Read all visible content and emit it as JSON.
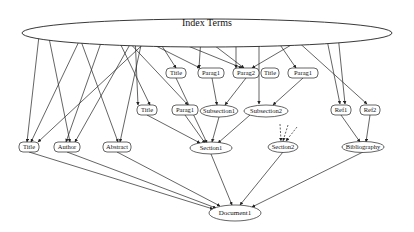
{
  "diagram": {
    "title_node": {
      "id": "index",
      "label": "Index Terms"
    },
    "nodes": [
      {
        "id": "it",
        "label": "Index Terms",
        "shape": "ellipse",
        "x": 207,
        "y": 33,
        "rx": 185,
        "ry": 14,
        "fs": 10
      },
      {
        "id": "t1",
        "label": "Title",
        "shape": "rounded",
        "x": 176,
        "y": 73,
        "w": 20,
        "fs": 6.5
      },
      {
        "id": "p1",
        "label": "Parag1",
        "shape": "rounded",
        "x": 211,
        "y": 73,
        "w": 26,
        "fs": 6.5
      },
      {
        "id": "p2",
        "label": "Parag2",
        "shape": "rounded",
        "x": 246,
        "y": 73,
        "w": 26,
        "fs": 6.5
      },
      {
        "id": "t2",
        "label": "Title",
        "shape": "rounded",
        "x": 270,
        "y": 73,
        "w": 18,
        "fs": 6.5
      },
      {
        "id": "p3",
        "label": "Parag1",
        "shape": "rounded",
        "x": 303,
        "y": 73,
        "w": 30,
        "fs": 6.5
      },
      {
        "id": "t3",
        "label": "Title",
        "shape": "rounded",
        "x": 147,
        "y": 110,
        "w": 20,
        "fs": 6.5
      },
      {
        "id": "p4",
        "label": "Parag1",
        "shape": "rounded",
        "x": 185,
        "y": 110,
        "w": 26,
        "fs": 6.5
      },
      {
        "id": "s1",
        "label": "Subsection1",
        "shape": "ellipse",
        "x": 219,
        "y": 111,
        "rx": 19,
        "ry": 6,
        "fs": 6.5
      },
      {
        "id": "s2",
        "label": "Subsection2",
        "shape": "ellipse",
        "x": 266,
        "y": 111,
        "rx": 22,
        "ry": 6,
        "fs": 6.5
      },
      {
        "id": "r1",
        "label": "Ref1",
        "shape": "rounded",
        "x": 341,
        "y": 110,
        "w": 20,
        "fs": 6.5
      },
      {
        "id": "r2",
        "label": "Ref2",
        "shape": "rounded",
        "x": 370,
        "y": 110,
        "w": 20,
        "fs": 6.5
      },
      {
        "id": "ta",
        "label": "Title",
        "shape": "rounded",
        "x": 29,
        "y": 147,
        "w": 20,
        "fs": 6.5
      },
      {
        "id": "au",
        "label": "Author",
        "shape": "rounded",
        "x": 67,
        "y": 147,
        "w": 26,
        "fs": 6.5
      },
      {
        "id": "ab",
        "label": "Abstract",
        "shape": "rounded",
        "x": 117,
        "y": 147,
        "w": 28,
        "fs": 6.5
      },
      {
        "id": "se1",
        "label": "Section1",
        "shape": "ellipse",
        "x": 211,
        "y": 148,
        "rx": 21,
        "ry": 6,
        "fs": 6.5
      },
      {
        "id": "se2",
        "label": "Section2",
        "shape": "ellipse",
        "x": 283,
        "y": 147,
        "rx": 15,
        "ry": 5.5,
        "fs": 6.5
      },
      {
        "id": "bib",
        "label": "Bibliography",
        "shape": "ellipse",
        "x": 363,
        "y": 147,
        "rx": 21,
        "ry": 5.5,
        "fs": 6.5
      },
      {
        "id": "doc",
        "label": "Document1",
        "shape": "ellipse",
        "x": 235,
        "y": 213,
        "rx": 26,
        "ry": 8,
        "fs": 7
      }
    ],
    "edges": [
      {
        "from": [
          40,
          27
        ],
        "to": [
          27,
          142
        ]
      },
      {
        "from": [
          47,
          28
        ],
        "to": [
          70,
          142
        ]
      },
      {
        "from": [
          83,
          33
        ],
        "to": [
          31,
          142
        ]
      },
      {
        "from": [
          78,
          33
        ],
        "to": [
          118,
          142
        ]
      },
      {
        "from": [
          103,
          37
        ],
        "to": [
          66,
          142
        ]
      },
      {
        "from": [
          117,
          37
        ],
        "to": [
          150,
          105
        ]
      },
      {
        "from": [
          152,
          36
        ],
        "to": [
          38,
          142
        ]
      },
      {
        "from": [
          125,
          38
        ],
        "to": [
          188,
          105
        ]
      },
      {
        "from": [
          137,
          32
        ],
        "to": [
          75,
          142
        ]
      },
      {
        "from": [
          135,
          35
        ],
        "to": [
          138,
          105
        ]
      },
      {
        "from": [
          143,
          36
        ],
        "to": [
          120,
          142
        ]
      },
      {
        "from": [
          155,
          35
        ],
        "to": [
          176,
          68
        ]
      },
      {
        "from": [
          161,
          35
        ],
        "to": [
          242,
          68
        ]
      },
      {
        "from": [
          134,
          35
        ],
        "to": [
          200,
          68
        ]
      },
      {
        "from": [
          201,
          37
        ],
        "to": [
          199,
          68
        ]
      },
      {
        "from": [
          202,
          36
        ],
        "to": [
          244,
          68
        ]
      },
      {
        "from": [
          236,
          38
        ],
        "to": [
          236,
          68
        ]
      },
      {
        "from": [
          259,
          37
        ],
        "to": [
          259,
          104
        ]
      },
      {
        "from": [
          274,
          36
        ],
        "to": [
          296,
          68
        ]
      },
      {
        "from": [
          315,
          31
        ],
        "to": [
          252,
          68
        ]
      },
      {
        "from": [
          285,
          30
        ],
        "to": [
          367,
          104
        ]
      },
      {
        "from": [
          326,
          35
        ],
        "to": [
          340,
          104
        ]
      },
      {
        "from": [
          338,
          35
        ],
        "to": [
          345,
          104
        ]
      },
      {
        "from": [
          176,
          78
        ],
        "to": [
          207,
          143
        ]
      },
      {
        "from": [
          212,
          78
        ],
        "to": [
          217,
          105
        ]
      },
      {
        "from": [
          246,
          78
        ],
        "to": [
          225,
          105
        ]
      },
      {
        "from": [
          303,
          78
        ],
        "to": [
          273,
          105
        ]
      },
      {
        "from": [
          147,
          115
        ],
        "to": [
          200,
          143
        ]
      },
      {
        "from": [
          185,
          115
        ],
        "to": [
          205,
          143
        ]
      },
      {
        "from": [
          219,
          117
        ],
        "to": [
          212,
          142
        ]
      },
      {
        "from": [
          250,
          115
        ],
        "to": [
          218,
          143
        ]
      },
      {
        "from": [
          341,
          115
        ],
        "to": [
          360,
          142
        ]
      },
      {
        "from": [
          370,
          115
        ],
        "to": [
          366,
          142
        ]
      },
      {
        "from": [
          29,
          152
        ],
        "to": [
          213,
          209
        ]
      },
      {
        "from": [
          67,
          152
        ],
        "to": [
          216,
          208
        ]
      },
      {
        "from": [
          117,
          152
        ],
        "to": [
          220,
          206
        ]
      },
      {
        "from": [
          211,
          154
        ],
        "to": [
          232,
          205
        ]
      },
      {
        "from": [
          283,
          152
        ],
        "to": [
          240,
          205
        ]
      },
      {
        "from": [
          363,
          152
        ],
        "to": [
          252,
          207
        ]
      }
    ],
    "dashed_edges": [
      {
        "from": [
          280,
          124
        ],
        "to": [
          281,
          141
        ]
      },
      {
        "from": [
          288,
          125
        ],
        "to": [
          283,
          141
        ]
      },
      {
        "from": [
          297,
          127
        ],
        "to": [
          286,
          141
        ]
      }
    ]
  }
}
